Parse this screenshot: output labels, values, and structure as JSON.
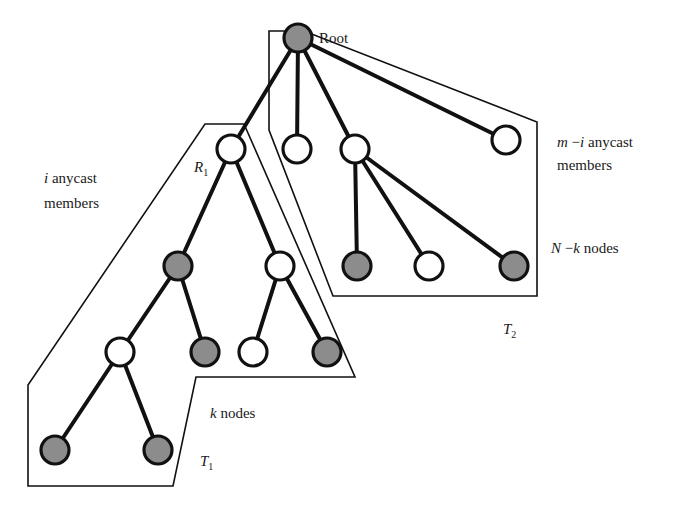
{
  "diagram": {
    "type": "tree-partition",
    "colors": {
      "member_node_fill": "#8c8c8c",
      "non_member_node_fill": "#ffffff",
      "stroke": "#111111"
    },
    "labels": {
      "root": "Root",
      "r1_main": "R",
      "r1_sub": "1",
      "t1_main": "T",
      "t1_sub": "1",
      "t2_main": "T",
      "t2_sub": "2",
      "i_var": "i",
      "i_members_line1_rest": " anycast",
      "i_members_line2": "members",
      "m_i_var_m": "m",
      "m_i_minus": " −",
      "m_i_var_i": "i",
      "m_i_line1_rest": " anycast",
      "m_i_line2": "members",
      "k_var": "k",
      "k_nodes_rest": " nodes",
      "nk_var_n": "N",
      "nk_minus": " −",
      "nk_var_k": "k",
      "nk_rest": " nodes"
    },
    "nodes": [
      {
        "id": "root",
        "x": 298,
        "y": 38,
        "type": "gray",
        "label": "Root"
      },
      {
        "id": "R1",
        "x": 231,
        "y": 149,
        "type": "white",
        "label": "R1"
      },
      {
        "id": "n2",
        "x": 297,
        "y": 149,
        "type": "white"
      },
      {
        "id": "n3",
        "x": 355,
        "y": 149,
        "type": "white"
      },
      {
        "id": "n4",
        "x": 506,
        "y": 140,
        "type": "white"
      },
      {
        "id": "n5",
        "x": 357,
        "y": 266,
        "type": "gray"
      },
      {
        "id": "n6",
        "x": 429,
        "y": 266,
        "type": "white"
      },
      {
        "id": "n7",
        "x": 514,
        "y": 266,
        "type": "gray"
      },
      {
        "id": "n8",
        "x": 178,
        "y": 266,
        "type": "gray"
      },
      {
        "id": "n9",
        "x": 280,
        "y": 266,
        "type": "white"
      },
      {
        "id": "n10",
        "x": 120,
        "y": 352,
        "type": "white"
      },
      {
        "id": "n11",
        "x": 205,
        "y": 352,
        "type": "gray"
      },
      {
        "id": "n12",
        "x": 253,
        "y": 352,
        "type": "white"
      },
      {
        "id": "n13",
        "x": 327,
        "y": 352,
        "type": "gray"
      },
      {
        "id": "n14",
        "x": 55,
        "y": 450,
        "type": "gray"
      },
      {
        "id": "n15",
        "x": 158,
        "y": 450,
        "type": "gray"
      }
    ],
    "edges": [
      [
        "root",
        "R1"
      ],
      [
        "root",
        "n2"
      ],
      [
        "root",
        "n3"
      ],
      [
        "root",
        "n4"
      ],
      [
        "n3",
        "n5"
      ],
      [
        "n3",
        "n6"
      ],
      [
        "n3",
        "n7"
      ],
      [
        "R1",
        "n8"
      ],
      [
        "R1",
        "n9"
      ],
      [
        "n8",
        "n10"
      ],
      [
        "n8",
        "n11"
      ],
      [
        "n9",
        "n12"
      ],
      [
        "n9",
        "n13"
      ],
      [
        "n10",
        "n14"
      ],
      [
        "n10",
        "n15"
      ]
    ],
    "regions": [
      {
        "id": "T1",
        "label": "T1",
        "description": "subtree rooted at R1, k nodes, i anycast members"
      },
      {
        "id": "T2",
        "label": "T2",
        "description": "remaining tree, N - k nodes, m - i anycast members"
      }
    ]
  }
}
